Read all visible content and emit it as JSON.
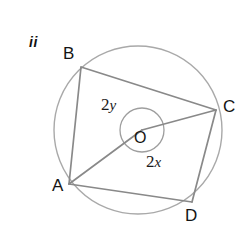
{
  "figure": {
    "index_label": "ii",
    "colors": {
      "circle_stroke": "#a8a8a8",
      "chord_stroke": "#8a8a8a",
      "arc_stroke": "#9e9e9e",
      "label_text": "#141414",
      "background": "#ffffff"
    },
    "circle": {
      "center_label": "O",
      "cx": 138,
      "cy": 130,
      "r": 84
    },
    "angle_arc": {
      "cx": 142,
      "cy": 130,
      "r": 22
    },
    "vertices": [
      {
        "name": "B",
        "label": "B",
        "x": 81,
        "y": 67
      },
      {
        "name": "C",
        "label": "C",
        "x": 216,
        "y": 110
      },
      {
        "name": "D",
        "label": "D",
        "x": 192,
        "y": 202
      },
      {
        "name": "A",
        "label": "A",
        "x": 69,
        "y": 184
      }
    ],
    "chords": [
      {
        "name": "chord-BC",
        "from": "B",
        "to": "C"
      },
      {
        "name": "chord-CD",
        "from": "C",
        "to": "D"
      },
      {
        "name": "chord-DA",
        "from": "D",
        "to": "A"
      },
      {
        "name": "chord-AB",
        "from": "A",
        "to": "B"
      }
    ],
    "radii": [
      {
        "name": "radius-OA",
        "from": "O",
        "to": "A"
      },
      {
        "name": "radius-OC",
        "from": "O",
        "to": "C"
      }
    ],
    "angle_labels": [
      {
        "name": "angle-2y",
        "coefficient": "2",
        "variable": "y",
        "position": "upper-left-of-centre"
      },
      {
        "name": "angle-2x",
        "coefficient": "2",
        "variable": "x",
        "position": "lower-right-of-centre"
      }
    ],
    "angle_2y_text": "2",
    "angle_2y_var": "y",
    "angle_2x_text": "2",
    "angle_2x_var": "x"
  }
}
